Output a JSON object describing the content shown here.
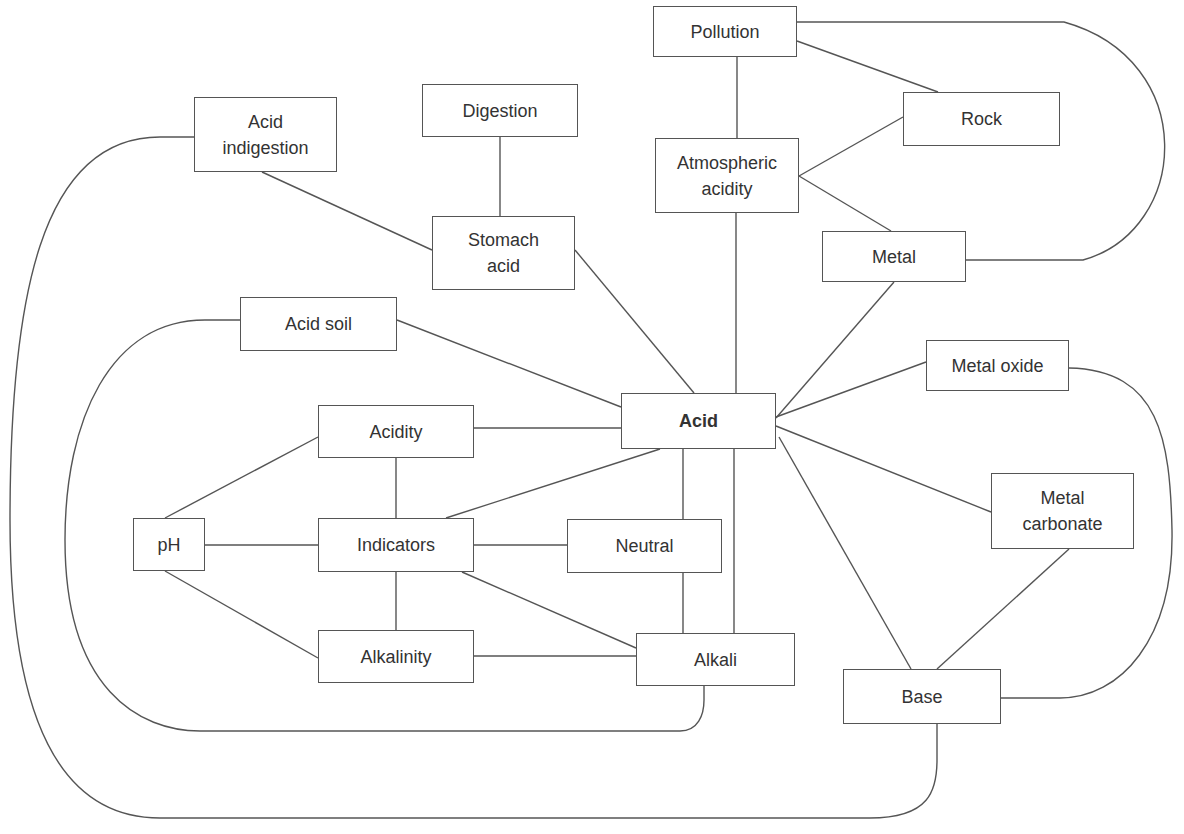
{
  "diagram": {
    "type": "concept-map",
    "central_node": "acid",
    "nodes": [
      {
        "id": "pollution",
        "label": "Pollution",
        "x": 653,
        "y": 6,
        "w": 144,
        "h": 51
      },
      {
        "id": "rock",
        "label": "Rock",
        "x": 903,
        "y": 92,
        "w": 157,
        "h": 54
      },
      {
        "id": "atmospheric-acidity",
        "label": "Atmospheric\nacidity",
        "x": 655,
        "y": 138,
        "w": 144,
        "h": 75
      },
      {
        "id": "metal",
        "label": "Metal",
        "x": 822,
        "y": 231,
        "w": 144,
        "h": 51
      },
      {
        "id": "metal-oxide",
        "label": "Metal oxide",
        "x": 926,
        "y": 340,
        "w": 143,
        "h": 51
      },
      {
        "id": "acid",
        "label": "Acid",
        "x": 621,
        "y": 393,
        "w": 155,
        "h": 56,
        "bold": true
      },
      {
        "id": "acid-indigestion",
        "label": "Acid\nindigestion",
        "x": 194,
        "y": 97,
        "w": 143,
        "h": 75
      },
      {
        "id": "digestion",
        "label": "Digestion",
        "x": 422,
        "y": 84,
        "w": 156,
        "h": 53
      },
      {
        "id": "stomach-acid",
        "label": "Stomach\nacid",
        "x": 432,
        "y": 216,
        "w": 143,
        "h": 74
      },
      {
        "id": "acid-soil",
        "label": "Acid soil",
        "x": 240,
        "y": 297,
        "w": 157,
        "h": 54
      },
      {
        "id": "acidity",
        "label": "Acidity",
        "x": 318,
        "y": 405,
        "w": 156,
        "h": 53
      },
      {
        "id": "ph",
        "label": "pH",
        "x": 133,
        "y": 518,
        "w": 72,
        "h": 53
      },
      {
        "id": "indicators",
        "label": "Indicators",
        "x": 318,
        "y": 518,
        "w": 156,
        "h": 54
      },
      {
        "id": "alkalinity",
        "label": "Alkalinity",
        "x": 318,
        "y": 630,
        "w": 156,
        "h": 53
      },
      {
        "id": "neutral",
        "label": "Neutral",
        "x": 567,
        "y": 519,
        "w": 155,
        "h": 54
      },
      {
        "id": "alkali",
        "label": "Alkali",
        "x": 636,
        "y": 633,
        "w": 159,
        "h": 53
      },
      {
        "id": "metal-carbonate",
        "label": "Metal\ncarbonate",
        "x": 991,
        "y": 473,
        "w": 143,
        "h": 76
      },
      {
        "id": "base",
        "label": "Base",
        "x": 843,
        "y": 669,
        "w": 158,
        "h": 55
      }
    ],
    "edges": [
      {
        "from": "pollution",
        "to": "atmospheric-acidity",
        "d": "M737 57 L737 138"
      },
      {
        "from": "pollution",
        "to": "rock",
        "d": "M797 41 L938 92"
      },
      {
        "from": "pollution",
        "to": "metal",
        "d": "M797 22 L1064 22 C1200 60 1190 230 1083 260 L966 260"
      },
      {
        "from": "atmospheric-acidity",
        "to": "rock",
        "d": "M799 176 L903 117"
      },
      {
        "from": "atmospheric-acidity",
        "to": "metal",
        "d": "M799 176 L891 231"
      },
      {
        "from": "atmospheric-acidity",
        "to": "acid",
        "d": "M736 213 L736 393"
      },
      {
        "from": "metal",
        "to": "acid",
        "d": "M894 282 L776 418"
      },
      {
        "from": "metal-oxide",
        "to": "acid",
        "d": "M926 362 L776 417"
      },
      {
        "from": "metal-oxide",
        "to": "base",
        "d": "M1069 368 C1160 370 1170 440 1172 530 C1174 640 1120 698 1060 698 L1001 698"
      },
      {
        "from": "digestion",
        "to": "stomach-acid",
        "d": "M500 137 L500 216"
      },
      {
        "from": "acid-indigestion",
        "to": "stomach-acid",
        "d": "M262 172 L432 250"
      },
      {
        "from": "stomach-acid",
        "to": "acid",
        "d": "M575 250 L694 393"
      },
      {
        "from": "acid-indigestion",
        "to": "base",
        "d": "M194 137 L160 137 C40 137 10 300 10 520 C10 720 60 818 160 818 L870 818 C930 818 937 790 937 760 L937 724"
      },
      {
        "from": "acid-soil",
        "to": "acid",
        "d": "M397 320 L621 407"
      },
      {
        "from": "acid-soil",
        "to": "alkali",
        "d": "M240 320 L205 320 C110 320 65 420 65 540 C65 690 140 731 200 731 L680 731 C698 731 704 715 704 700 L704 686"
      },
      {
        "from": "acidity",
        "to": "acid",
        "d": "M474 428 L621 428"
      },
      {
        "from": "acidity",
        "to": "indicators",
        "d": "M396 458 L396 518"
      },
      {
        "from": "ph",
        "to": "acidity",
        "d": "M165 518 L318 437"
      },
      {
        "from": "ph",
        "to": "indicators",
        "d": "M205 545 L318 545"
      },
      {
        "from": "ph",
        "to": "alkalinity",
        "d": "M165 571 L318 658"
      },
      {
        "from": "indicators",
        "to": "acid",
        "d": "M446 518 L660 449"
      },
      {
        "from": "indicators",
        "to": "neutral",
        "d": "M474 545 L567 545"
      },
      {
        "from": "indicators",
        "to": "alkalinity",
        "d": "M396 572 L396 630"
      },
      {
        "from": "indicators",
        "to": "alkali",
        "d": "M462 572 L636 648"
      },
      {
        "from": "alkalinity",
        "to": "alkali",
        "d": "M474 656 L636 656"
      },
      {
        "from": "acid",
        "to": "neutral",
        "d": "M683 449 L683 519"
      },
      {
        "from": "neutral",
        "to": "alkali",
        "d": "M683 573 L683 633"
      },
      {
        "from": "acid",
        "to": "alkali",
        "d": "M734 449 L734 633"
      },
      {
        "from": "acid",
        "to": "metal-carbonate",
        "d": "M776 426 L991 512"
      },
      {
        "from": "acid",
        "to": "base",
        "d": "M779 437 L911 669"
      },
      {
        "from": "metal-carbonate",
        "to": "base",
        "d": "M1069 549 L937 669"
      }
    ]
  }
}
